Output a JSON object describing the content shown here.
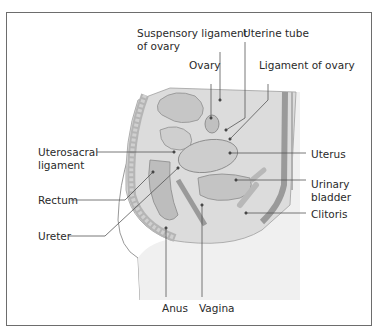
{
  "diagram": {
    "type": "anatomical-illustration",
    "labels": {
      "suspensory_ligament": [
        "Suspensory ligament",
        "of ovary"
      ],
      "uterine_tube": "Uterine tube",
      "ovary": "Ovary",
      "ligament_of_ovary": "Ligament of ovary",
      "uterosacral": [
        "Uterosacral",
        "ligament"
      ],
      "uterus": "Uterus",
      "rectum": "Rectum",
      "urinary_bladder": [
        "Urinary",
        "bladder"
      ],
      "clitoris": "Clitoris",
      "ureter": "Ureter",
      "anus": "Anus",
      "vagina": "Vagina"
    },
    "colors": {
      "border": "#6d6d6d",
      "leader_line": "#555555",
      "tissue_light": "#e6e6e6",
      "tissue_mid": "#c8c8c8",
      "tissue_dark": "#9a9a9a",
      "text": "#2a2a2a"
    }
  }
}
